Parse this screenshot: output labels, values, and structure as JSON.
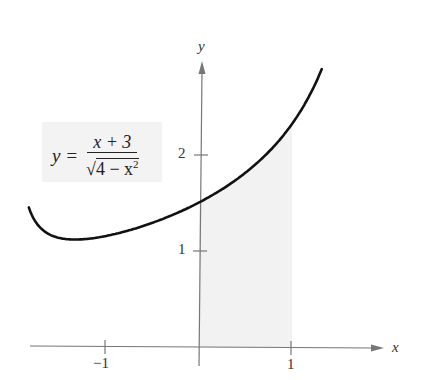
{
  "chart_data": {
    "type": "line",
    "title": "",
    "function": "y = (x + 3) / sqrt(4 - x^2)",
    "equation_label": {
      "lhs": "y =",
      "numerator": "x + 3",
      "denominator_radicand": "4 − x",
      "denominator_exponent": "2"
    },
    "xlabel": "x",
    "ylabel": "y",
    "xlim": [
      -1.83,
      1.32
    ],
    "ylim": [
      0,
      2.9
    ],
    "x_ticks": [
      {
        "value": -1,
        "label": "−1"
      },
      {
        "value": 1,
        "label": "1"
      }
    ],
    "y_ticks": [
      {
        "value": 1,
        "label": "1"
      },
      {
        "value": 2,
        "label": "2"
      }
    ],
    "shaded_region": {
      "x_from": 0,
      "x_to": 1,
      "under": "curve",
      "color": "#f2f2f2"
    },
    "series": [
      {
        "name": "y = (x+3)/sqrt(4-x^2)",
        "x": [
          -1.83,
          -1.6,
          -1.4,
          -1.2,
          -1.0,
          -0.8,
          -0.6,
          -0.4,
          -0.2,
          0,
          0.2,
          0.4,
          0.6,
          0.8,
          1.0,
          1.1,
          1.2,
          1.3
        ],
        "y": [
          1.45,
          1.17,
          1.12,
          1.13,
          1.15,
          1.2,
          1.26,
          1.33,
          1.41,
          1.5,
          1.61,
          1.73,
          1.89,
          2.07,
          2.31,
          2.46,
          2.63,
          2.83
        ]
      }
    ],
    "grid": false,
    "legend": "none"
  },
  "colors": {
    "curve": "#111111",
    "axis": "#777777",
    "shade": "#f2f2f2",
    "label_box": "#f3f3f3"
  }
}
